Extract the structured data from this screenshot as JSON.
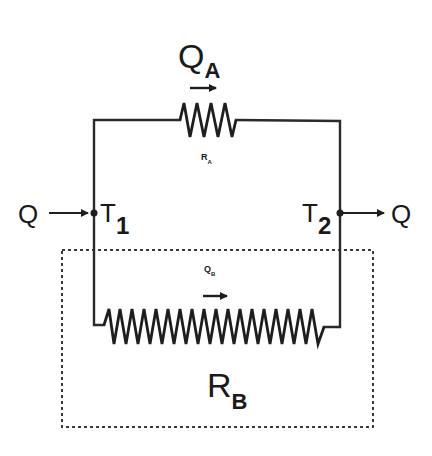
{
  "diagram": {
    "type": "thermal resistance network (parallel paths)",
    "heat_in": {
      "label": "Q"
    },
    "heat_out": {
      "label": "Q"
    },
    "node_left": {
      "label": "T",
      "sub": "1"
    },
    "node_right": {
      "label": "T",
      "sub": "2"
    },
    "upper_branch": {
      "flow_label": "Q",
      "flow_sub": "A",
      "resistor_label": "R",
      "resistor_sub": "A"
    },
    "lower_branch": {
      "flow_label": "Q",
      "flow_sub": "B",
      "resistor_label": "R",
      "resistor_sub": "B",
      "enclosed_in_dashed_box": true
    },
    "colors": {
      "line": "#2a2a2a",
      "background": "#ffffff"
    }
  }
}
